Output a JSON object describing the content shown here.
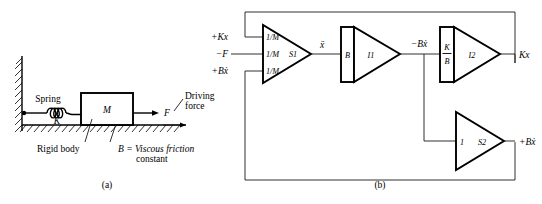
{
  "figure": {
    "panel_a": {
      "caption": "(a)",
      "labels": {
        "spring": "Spring",
        "spring_constant": "K",
        "mass": "M",
        "force": "F",
        "driving_force_line1": "Driving",
        "driving_force_line2": "force",
        "rigid_body": "Rigid body",
        "friction_line1": "B = Viscous friction",
        "friction_line2": "constant"
      }
    },
    "panel_b": {
      "caption": "(b)",
      "inputs": [
        {
          "name": "spring-force-input",
          "label": "+Kx"
        },
        {
          "name": "driving-force-input",
          "label": "−F"
        },
        {
          "name": "damping-force-input",
          "label": "+Bẋ"
        }
      ],
      "blocks": [
        {
          "name": "summer-s1",
          "id": "S1",
          "type": "summer",
          "gains": [
            "1/M",
            "1/M",
            "1/M"
          ]
        },
        {
          "name": "integrator-i1",
          "id": "I1",
          "type": "integrator",
          "gain": "B"
        },
        {
          "name": "integrator-i2",
          "id": "I2",
          "type": "integrator",
          "gain_numerator": "K",
          "gain_denominator": "B"
        },
        {
          "name": "summer-s2",
          "id": "S2",
          "type": "summer",
          "gain": "1"
        }
      ],
      "signals": {
        "acceleration": "ẍ",
        "damping_negative": "−Bẋ",
        "spring_output": "Kx",
        "damping_positive": "+Bẋ"
      }
    }
  }
}
